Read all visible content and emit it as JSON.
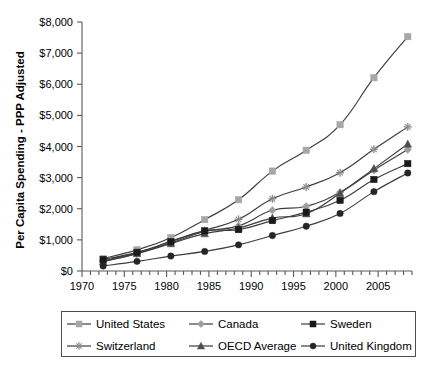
{
  "chart_data": {
    "type": "line",
    "title": "",
    "xlabel": "",
    "ylabel": "Per Capita Spending - PPP Adjusted",
    "xlim": [
      1970,
      2009
    ],
    "ylim": [
      0,
      8000
    ],
    "grid": false,
    "legend_position": "bottom",
    "x_ticks": [
      1970,
      1975,
      1980,
      1985,
      1990,
      1995,
      2000,
      2005
    ],
    "x_tick_labels": [
      "1970",
      "1975",
      "1980",
      "1985",
      "1990",
      "1995",
      "2000",
      "2005"
    ],
    "y_ticks": [
      0,
      1000,
      2000,
      3000,
      4000,
      5000,
      6000,
      7000,
      8000
    ],
    "y_tick_labels": [
      "$0",
      "$1,000",
      "$2,000",
      "$3,000",
      "$4,000",
      "$5,000",
      "$6,000",
      "$7,000",
      "$8,000"
    ],
    "x": [
      1972.5,
      1976.5,
      1980.5,
      1984.5,
      1988.5,
      1992.5,
      1996.5,
      2000.5,
      2004.5,
      2008.5
    ],
    "series": [
      {
        "name": "United States",
        "color": "#a6a6a6",
        "marker": "square",
        "values": [
          400,
          680,
          1070,
          1650,
          2290,
          3210,
          3880,
          4700,
          6210,
          7530
        ]
      },
      {
        "name": "Switzerland",
        "color": "#8c8c8c",
        "marker": "star",
        "values": [
          300,
          560,
          960,
          1300,
          1660,
          2320,
          2700,
          3160,
          3910,
          4630
        ]
      },
      {
        "name": "Canada",
        "color": "#9e9e9e",
        "marker": "diamond",
        "values": [
          330,
          590,
          900,
          1270,
          1450,
          1950,
          2080,
          2530,
          3240,
          3900
        ]
      },
      {
        "name": "OECD Average",
        "color": "#4d4d4d",
        "marker": "triangle",
        "values": [
          310,
          560,
          880,
          1200,
          1380,
          1700,
          1840,
          2500,
          3290,
          4080
        ]
      },
      {
        "name": "Sweden",
        "color": "#1a1a1a",
        "marker": "square",
        "values": [
          370,
          600,
          940,
          1290,
          1330,
          1620,
          1890,
          2270,
          2940,
          3450
        ]
      },
      {
        "name": "United Kingdom",
        "color": "#262626",
        "marker": "circle",
        "values": [
          160,
          310,
          480,
          630,
          840,
          1140,
          1440,
          1850,
          2550,
          3150
        ]
      }
    ]
  },
  "legend": {
    "items": [
      {
        "label": "United States",
        "series_index": 0
      },
      {
        "label": "Switzerland",
        "series_index": 1
      },
      {
        "label": "Canada",
        "series_index": 2
      },
      {
        "label": "OECD Average",
        "series_index": 3
      },
      {
        "label": "Sweden",
        "series_index": 4
      },
      {
        "label": "United Kingdom",
        "series_index": 5
      }
    ]
  }
}
